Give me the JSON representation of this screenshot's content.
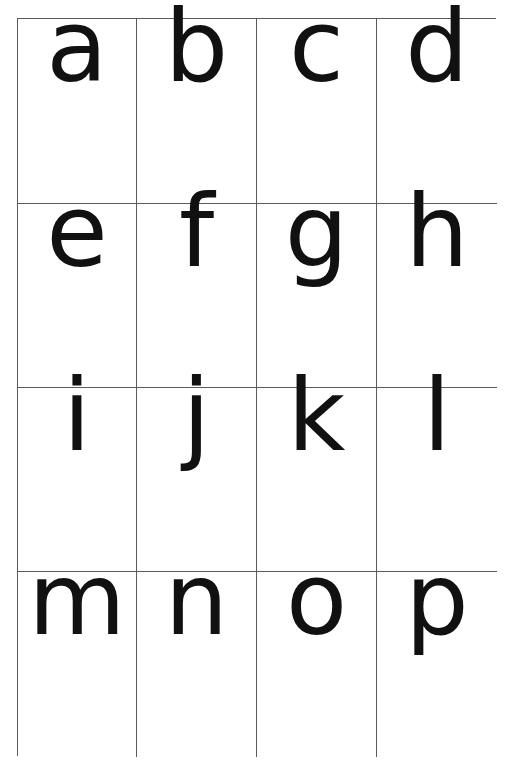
{
  "sheet": {
    "colors": {
      "grid_line": "#5a5a5a",
      "letter": "#111111",
      "background": "#ffffff"
    },
    "rows": [
      {
        "cards": [
          {
            "letter": "a"
          },
          {
            "letter": "b"
          },
          {
            "letter": "c"
          },
          {
            "letter": "d"
          }
        ]
      },
      {
        "cards": [
          {
            "letter": "e"
          },
          {
            "letter": "f"
          },
          {
            "letter": "g"
          },
          {
            "letter": "h"
          }
        ]
      },
      {
        "cards": [
          {
            "letter": "i"
          },
          {
            "letter": "j"
          },
          {
            "letter": "k"
          },
          {
            "letter": "l"
          }
        ]
      },
      {
        "cards": [
          {
            "letter": "m"
          },
          {
            "letter": "n"
          },
          {
            "letter": "o"
          },
          {
            "letter": "p"
          }
        ]
      }
    ]
  }
}
